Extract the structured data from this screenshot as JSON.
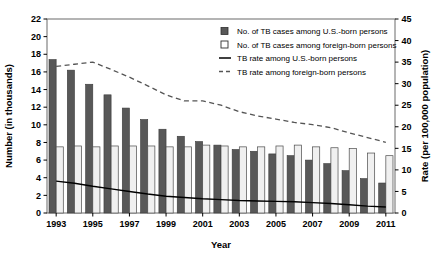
{
  "chart_data": {
    "type": "bar",
    "title": "",
    "xlabel": "Year",
    "ylabel": "Number (in thousands)",
    "y2label": "Rate (per 100,000 population)",
    "grid": false,
    "legend_position": "top-right",
    "x": [
      1993,
      1994,
      1995,
      1996,
      1997,
      1998,
      1999,
      2000,
      2001,
      2002,
      2003,
      2004,
      2005,
      2006,
      2007,
      2008,
      2009,
      2010,
      2011
    ],
    "categories": [
      "1993",
      "1994",
      "1995",
      "1996",
      "1997",
      "1998",
      "1999",
      "2000",
      "2001",
      "2002",
      "2003",
      "2004",
      "2005",
      "2006",
      "2007",
      "2008",
      "2009",
      "2010",
      "2011"
    ],
    "xtick_labels": [
      "1993",
      "",
      "1995",
      "",
      "1997",
      "",
      "1999",
      "",
      "2001",
      "",
      "2003",
      "",
      "2005",
      "",
      "2007",
      "",
      "2009",
      "",
      "2011"
    ],
    "ylim": [
      0,
      22
    ],
    "yticks": [
      0,
      2,
      4,
      6,
      8,
      10,
      12,
      14,
      16,
      18,
      20,
      22
    ],
    "y2lim": [
      0,
      45
    ],
    "y2ticks": [
      0,
      5,
      10,
      15,
      20,
      25,
      30,
      35,
      40,
      45
    ],
    "series": [
      {
        "name": "No. of TB cases among U.S.-born persons",
        "kind": "bar",
        "axis": "left",
        "color": "#585858",
        "values": [
          17.4,
          16.2,
          14.6,
          13.4,
          11.9,
          10.6,
          9.5,
          8.7,
          8.1,
          7.7,
          7.2,
          7.0,
          6.7,
          6.5,
          6.0,
          5.6,
          4.8,
          3.9,
          3.4
        ]
      },
      {
        "name": "No. of TB cases among foreign-born persons",
        "kind": "bar",
        "axis": "left",
        "color": "#f0f0f0",
        "values": [
          7.5,
          7.6,
          7.5,
          7.6,
          7.6,
          7.6,
          7.5,
          7.5,
          7.7,
          7.6,
          7.5,
          7.5,
          7.6,
          7.7,
          7.5,
          7.4,
          7.3,
          6.8,
          6.5
        ]
      },
      {
        "name": "TB rate among U.S.-born persons",
        "kind": "line",
        "axis": "right",
        "style": "solid",
        "color": "#000000",
        "values": [
          7.4,
          6.9,
          6.2,
          5.6,
          5.0,
          4.4,
          3.9,
          3.6,
          3.3,
          3.1,
          2.9,
          2.8,
          2.7,
          2.6,
          2.4,
          2.2,
          1.9,
          1.6,
          1.4
        ]
      },
      {
        "name": "TB rate among foreign-born persons",
        "kind": "line",
        "axis": "right",
        "style": "dashed",
        "color": "#555555",
        "values": [
          34.0,
          34.5,
          35.0,
          33.3,
          31.5,
          29.5,
          27.4,
          26.0,
          26.0,
          25.0,
          23.5,
          22.5,
          21.8,
          21.0,
          20.5,
          19.8,
          18.6,
          17.5,
          16.4
        ]
      }
    ]
  },
  "legend": {
    "items": [
      {
        "label": "No. of TB cases among U.S.-born persons",
        "marker": "filled-square",
        "color": "#585858"
      },
      {
        "label": "No. of TB cases among foreign-born persons",
        "marker": "open-square",
        "color": "#ffffff"
      },
      {
        "label": "TB rate among U.S.-born persons",
        "marker": "solid-line",
        "color": "#000000"
      },
      {
        "label": "TB rate among foreign-born persons",
        "marker": "dashed-line",
        "color": "#555555"
      }
    ]
  }
}
